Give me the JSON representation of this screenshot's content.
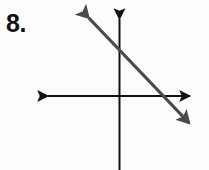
{
  "page": {
    "background_color": "#fdfdfd",
    "width": 209,
    "height": 170
  },
  "problem": {
    "number_label": "8.",
    "number_color": "#111111"
  },
  "chart_data": {
    "type": "line",
    "title": "",
    "subtitle": "",
    "xlabel": "",
    "ylabel": "",
    "grid": false,
    "legend": null,
    "axes": {
      "origin_px": {
        "x": 119,
        "y": 96
      },
      "x_axis": {
        "name": "x-axis",
        "orientation": "horizontal",
        "color": "#111111",
        "stroke_width": 2,
        "y_px": 96,
        "start_px": 44,
        "end_px": 194,
        "arrow_start": true,
        "arrow_end": true,
        "tick_labels": [],
        "visible_range_note": "unlabeled axis, arrowheads on both ends"
      },
      "y_axis": {
        "name": "y-axis",
        "orientation": "vertical",
        "color": "#111111",
        "stroke_width": 2,
        "x_px": 119,
        "start_px": 15,
        "end_px": 170,
        "arrow_start": true,
        "arrow_end": false,
        "tick_labels": [],
        "visible_range_note": "arrowhead at top only; bottom end runs off the image edge"
      }
    },
    "series": [
      {
        "name": "plotted-line",
        "description": "single straight line with arrowheads at both ends, negative slope",
        "color": "#4a4a4a",
        "stroke_width": 3,
        "arrow_start": true,
        "arrow_end": true,
        "endpoints_px": [
          {
            "x": 86,
            "y": 15
          },
          {
            "x": 192,
            "y": 126
          }
        ],
        "intercepts_px": {
          "y_intercept": {
            "x": 119,
            "y": 49
          },
          "x_intercept": {
            "x": 163,
            "y": 96
          }
        },
        "slope_estimate": -1.05,
        "direction": "upper-left to lower-right"
      }
    ]
  }
}
